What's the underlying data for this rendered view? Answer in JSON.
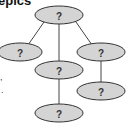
{
  "header": {
    "title_fragment": "epics"
  },
  "side_marks": [
    ",",
    "."
  ],
  "diagram": {
    "type": "tree",
    "fill_color": "#d4d4d4",
    "stroke_color": "#333333",
    "nodes": [
      {
        "id": "root",
        "label": "?"
      },
      {
        "id": "left-child",
        "label": "?"
      },
      {
        "id": "middle-child",
        "label": "?"
      },
      {
        "id": "right-child",
        "label": "?"
      },
      {
        "id": "middle-grandchild",
        "label": "?"
      },
      {
        "id": "right-grandchild",
        "label": "?"
      }
    ],
    "edges": [
      [
        "root",
        "left-child"
      ],
      [
        "root",
        "middle-child"
      ],
      [
        "root",
        "right-child"
      ],
      [
        "middle-child",
        "middle-grandchild"
      ],
      [
        "right-child",
        "right-grandchild"
      ]
    ]
  }
}
